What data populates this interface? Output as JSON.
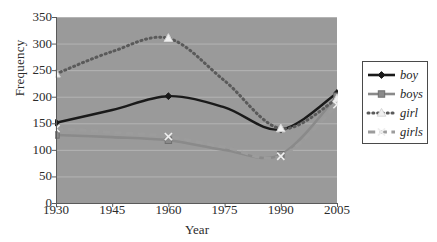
{
  "chart_data": {
    "type": "line",
    "title": "",
    "xlabel": "Year",
    "ylabel": "Frequency",
    "x": [
      1930,
      1945,
      1960,
      1975,
      1990,
      2005
    ],
    "categories": [
      "1930",
      "1945",
      "1960",
      "1975",
      "1990",
      "2005"
    ],
    "xlim": [
      1930,
      2005
    ],
    "ylim": [
      0,
      350
    ],
    "yticks": [
      0,
      50,
      100,
      150,
      200,
      250,
      300,
      350
    ],
    "ytick_labels": [
      "0",
      "50",
      "100",
      "150",
      "200",
      "250",
      "300",
      "350"
    ],
    "grid": "horizontal",
    "legend_position": "right",
    "plot_background": "#9a9a9a",
    "gridline_color": "#b4b4b4",
    "series": [
      {
        "name": "boy",
        "color": "#1a1a1a",
        "line_style": "solid",
        "marker": "diamond",
        "values": [
          151,
          175,
          201,
          180,
          138,
          207
        ]
      },
      {
        "name": "boys",
        "color": "#8a8a8a",
        "line_style": "solid",
        "marker": "square",
        "values": [
          128,
          124,
          118,
          100,
          91,
          201
        ]
      },
      {
        "name": "girl",
        "color": "#5a5a5a",
        "line_style": "dotted",
        "marker": "triangle",
        "values": [
          243,
          285,
          310,
          230,
          140,
          196
        ]
      },
      {
        "name": "girls",
        "color": "#9c9c9c",
        "line_style": "dashed",
        "marker": "cross",
        "values": [
          140,
          133,
          125,
          105,
          88,
          185
        ]
      }
    ]
  },
  "legend": {
    "items": [
      {
        "label": "boy"
      },
      {
        "label": "boys"
      },
      {
        "label": "girl"
      },
      {
        "label": "girls"
      }
    ]
  },
  "axes": {
    "y_title": "Frequency",
    "x_title": "Year"
  }
}
